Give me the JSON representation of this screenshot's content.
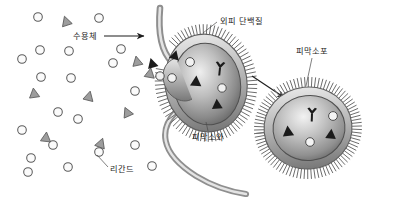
{
  "figure": {
    "background_color": "#ffffff",
    "line_color": "#4a4a4a",
    "ink_color": "#1c1c1c"
  },
  "labels": {
    "receptor": "수용체",
    "coat_protein": "외피 단백질",
    "coated_vesicle": "피막소포",
    "coated_pit": "피막소와",
    "ligand": "리간드"
  },
  "chart_data": {
    "type": "diagram",
    "annotations": [
      {
        "id": "receptor",
        "text": "수용체",
        "x": 73,
        "y": 38,
        "anchor_x": 146,
        "anchor_y": 36,
        "marker": "arrow"
      },
      {
        "id": "coat-protein",
        "text": "외피 단백질",
        "x": 219,
        "y": 23,
        "anchor_x": 205,
        "anchor_y": 35,
        "marker": "leader"
      },
      {
        "id": "coated-vesicle",
        "text": "피막소포",
        "x": 300,
        "y": 55,
        "anchor_x": 309,
        "anchor_y": 86,
        "marker": "leader"
      },
      {
        "id": "coated-pit",
        "text": "피막소와",
        "x": 197,
        "y": 137,
        "anchor_x": 205,
        "anchor_y": 124,
        "marker": "leader"
      },
      {
        "id": "ligand",
        "text": "리간드",
        "x": 110,
        "y": 170,
        "anchor_x": 96,
        "anchor_y": 154,
        "marker": "leader"
      }
    ],
    "free_ligands_circles": [
      {
        "x": 38,
        "y": 17
      },
      {
        "x": 99,
        "y": 18
      },
      {
        "x": 22,
        "y": 59
      },
      {
        "x": 40,
        "y": 50
      },
      {
        "x": 69,
        "y": 51
      },
      {
        "x": 121,
        "y": 49
      },
      {
        "x": 41,
        "y": 77
      },
      {
        "x": 71,
        "y": 78
      },
      {
        "x": 113,
        "y": 63
      },
      {
        "x": 135,
        "y": 91
      },
      {
        "x": 58,
        "y": 112
      },
      {
        "x": 78,
        "y": 119
      },
      {
        "x": 22,
        "y": 130
      },
      {
        "x": 53,
        "y": 145
      },
      {
        "x": 31,
        "y": 158
      },
      {
        "x": 28,
        "y": 172
      },
      {
        "x": 68,
        "y": 167
      },
      {
        "x": 99,
        "y": 152
      },
      {
        "x": 135,
        "y": 145
      },
      {
        "x": 152,
        "y": 166
      }
    ],
    "free_ligands_triangles": [
      {
        "x": 66,
        "y": 21,
        "r": 0
      },
      {
        "x": 34,
        "y": 93,
        "r": 0
      },
      {
        "x": 89,
        "y": 96,
        "r": 0
      },
      {
        "x": 127,
        "y": 112,
        "r": 0
      },
      {
        "x": 46,
        "y": 137,
        "r": 0
      },
      {
        "x": 101,
        "y": 143,
        "r": 0
      },
      {
        "x": 137,
        "y": 61,
        "r": 0
      },
      {
        "x": 150,
        "y": 73,
        "r": 0
      }
    ],
    "structures": [
      {
        "id": "plasma-membrane",
        "kind": "curved-bilayer",
        "description": "cell membrane invaginating"
      },
      {
        "id": "coated-pit",
        "kind": "invagination",
        "cx": 205,
        "cy": 82,
        "rx": 42,
        "ry": 50,
        "interior_receptors": 3,
        "interior_ligand_circles": 3,
        "coat_bristles": true
      },
      {
        "id": "coated-vesicle",
        "kind": "detached-vesicle",
        "cx": 308,
        "cy": 128,
        "rx": 44,
        "ry": 42,
        "interior_receptors": 3,
        "interior_ligand_circles": 2,
        "coat_bristles": true
      }
    ],
    "process_arrow": {
      "from_x": 252,
      "from_y": 76,
      "to_x": 287,
      "to_y": 99
    }
  }
}
